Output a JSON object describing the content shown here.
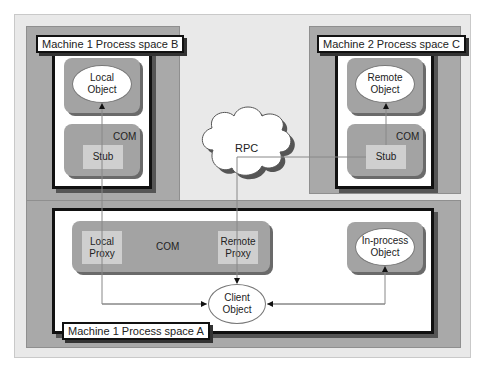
{
  "diagram": {
    "panels": {
      "process_b": {
        "label": "Machine 1 Process space B",
        "object": "Local Object",
        "com_label": "COM",
        "stub": "Stub"
      },
      "process_c": {
        "label": "Machine 2 Process space C",
        "object": "Remote Object",
        "com_label": "COM",
        "stub": "Stub"
      },
      "process_a": {
        "label": "Machine 1 Process space A",
        "com_label": "COM",
        "local_proxy": "Local Proxy",
        "remote_proxy": "Remote Proxy",
        "inprocess_object": "In-process Object",
        "client_object": "Client Object"
      }
    },
    "rpc": {
      "label": "RPC"
    },
    "connections": [
      {
        "from": "Client Object",
        "to": "Local Proxy",
        "via": "Stub (Process space B)",
        "to_final": "Local Object"
      },
      {
        "from": "Client Object",
        "to": "Remote Proxy",
        "via": "RPC / Stub (Process space C)",
        "to_final": "Remote Object"
      },
      {
        "from": "Client Object",
        "to": "In-process Object",
        "bidirectional": true
      }
    ],
    "colors": {
      "frame": "#e9e9e9",
      "gray_region": "#a9a9a9",
      "com_block": "#a3a3a3",
      "stub_proxy": "#cfcfcf",
      "line": "#888888"
    }
  }
}
